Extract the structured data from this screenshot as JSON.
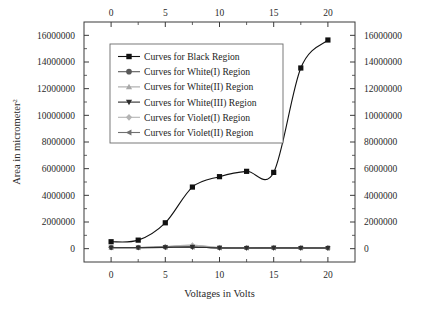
{
  "chart_data": {
    "type": "line",
    "title": "",
    "xlabel": "Voltages in Volts",
    "ylabel": "Area in micrometer",
    "ylabel_superscript": "2",
    "xlim": [
      -2.5,
      22.5
    ],
    "ylim": [
      -1000000,
      17000000
    ],
    "xticks": [
      0,
      5,
      10,
      15,
      20
    ],
    "xtick_labels": [
      "0",
      "5",
      "10",
      "15",
      "20"
    ],
    "xticks_minor": [
      2.5,
      7.5,
      12.5,
      17.5
    ],
    "yticks": [
      0,
      2000000,
      4000000,
      6000000,
      8000000,
      10000000,
      12000000,
      14000000,
      16000000
    ],
    "ytick_labels": [
      "0",
      "2000000",
      "4000000",
      "6000000",
      "8000000",
      "10000000",
      "12000000",
      "14000000",
      "16000000"
    ],
    "yticks_minor": [
      1000000,
      3000000,
      5000000,
      7000000,
      9000000,
      11000000,
      13000000,
      15000000
    ],
    "grid": false,
    "top_axis_mirrored": true,
    "right_axis_mirrored": true,
    "legend_position": "upper-left-inside",
    "x": [
      0,
      2.5,
      5,
      7.5,
      10,
      12.5,
      15,
      17.5,
      20
    ],
    "series": [
      {
        "name": "Curves for Black Region",
        "marker": "square",
        "color": "#111111",
        "values": [
          520000,
          640000,
          1940000,
          4620000,
          5400000,
          5800000,
          5720000,
          13550000,
          15650000
        ]
      },
      {
        "name": "Curves for White(I) Region",
        "marker": "circle",
        "color": "#595959",
        "values": [
          90000,
          85000,
          110000,
          130000,
          60000,
          55000,
          60000,
          55000,
          50000
        ]
      },
      {
        "name": "Curves for White(II) Region",
        "marker": "triangle-up",
        "color": "#a8a8a8",
        "values": [
          80000,
          75000,
          150000,
          250000,
          70000,
          60000,
          65000,
          60000,
          55000
        ]
      },
      {
        "name": "Curves for White(III) Region",
        "marker": "triangle-down",
        "color": "#2e2e2e",
        "values": [
          70000,
          70000,
          95000,
          115000,
          55000,
          50000,
          55000,
          50000,
          45000
        ]
      },
      {
        "name": "Curves for Violet(I) Region",
        "marker": "diamond",
        "color": "#b4b4b4",
        "values": [
          95000,
          90000,
          160000,
          270000,
          75000,
          65000,
          70000,
          62000,
          58000
        ]
      },
      {
        "name": "Curves for Violet(II) Region",
        "marker": "triangle-left",
        "color": "#707070",
        "values": [
          75000,
          72000,
          100000,
          120000,
          58000,
          52000,
          58000,
          52000,
          48000
        ]
      }
    ]
  },
  "legend": {
    "entries": [
      "Curves for Black Region",
      "Curves for White(I) Region",
      "Curves for White(II) Region",
      "Curves for White(III) Region",
      "Curves for Violet(I) Region",
      "Curves for Violet(II) Region"
    ]
  },
  "colors": {
    "axis": "#3a3a3a",
    "text": "#222222",
    "background": "#ffffff",
    "legend_border": "#6a6a6a"
  }
}
